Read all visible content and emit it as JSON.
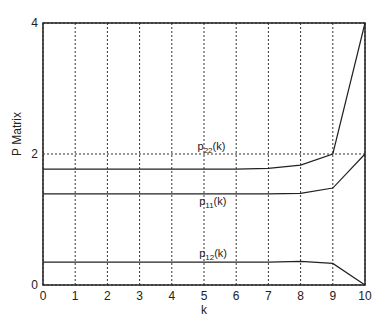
{
  "chart_data": {
    "type": "line",
    "title": "",
    "xlabel": "k",
    "ylabel": "P Matrix",
    "xlim": [
      0,
      10
    ],
    "ylim": [
      0,
      4
    ],
    "xticks": [
      "0",
      "1",
      "2",
      "3",
      "4",
      "5",
      "6",
      "7",
      "8",
      "9",
      "10"
    ],
    "yticks": [
      "0",
      "2",
      "4"
    ],
    "grid": true,
    "x": [
      0,
      1,
      2,
      3,
      4,
      5,
      6,
      7,
      8,
      9,
      10
    ],
    "series": [
      {
        "name": "p22(k)",
        "label_main": "p",
        "label_sub": "22",
        "label_tail": "(k)",
        "values": [
          1.77,
          1.77,
          1.77,
          1.77,
          1.77,
          1.77,
          1.77,
          1.78,
          1.83,
          2.0,
          4.0
        ]
      },
      {
        "name": "p11(k)",
        "label_main": "p",
        "label_sub": "11",
        "label_tail": "(k)",
        "values": [
          1.39,
          1.39,
          1.39,
          1.39,
          1.39,
          1.39,
          1.39,
          1.39,
          1.4,
          1.48,
          2.0
        ]
      },
      {
        "name": "p12(k)",
        "label_main": "p",
        "label_sub": "12",
        "label_tail": "(k)",
        "values": [
          0.35,
          0.35,
          0.35,
          0.35,
          0.35,
          0.35,
          0.35,
          0.35,
          0.36,
          0.33,
          0.0
        ]
      }
    ],
    "annotations": [
      {
        "series": 0,
        "x": 4.8,
        "y": 2.06
      },
      {
        "series": 1,
        "x": 4.85,
        "y": 1.22
      },
      {
        "series": 2,
        "x": 4.85,
        "y": 0.43
      }
    ]
  }
}
